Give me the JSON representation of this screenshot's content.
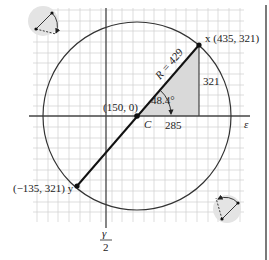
{
  "diagram": {
    "axes": {
      "horizontal_label": "ε",
      "vertical_label_numerator": "γ",
      "vertical_label_denominator": "2"
    },
    "center": {
      "label": "C",
      "coords_label": "(150, 0)"
    },
    "point_x": {
      "label": "x (435, 321)"
    },
    "point_y": {
      "label": "(−135, 321) y"
    },
    "radius_label": "R = 429",
    "angle_label": "48.4°",
    "triangle": {
      "horizontal_leg": "285",
      "vertical_leg": "321"
    },
    "icons": {
      "top_left": "rotation-direction-icon-counterclockwise",
      "bottom_right": "rotation-direction-icon-clockwise"
    },
    "colors": {
      "line": "#222222",
      "grid": "#cccccc",
      "shade": "#d9d9d9",
      "icon_bg": "#e6e6e6"
    }
  }
}
